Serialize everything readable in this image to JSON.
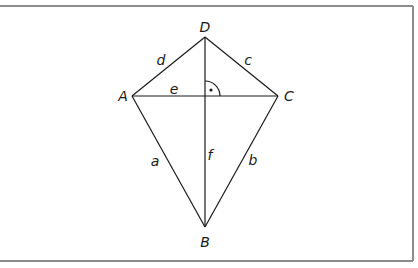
{
  "diagram": {
    "type": "geometry-figure",
    "colors": {
      "background": "#ffffff",
      "frame": "#8c8c8c",
      "lines": "#1a1a1a",
      "labels": "#1a1a1a"
    },
    "frame": {
      "top_y": 6,
      "right_x": 413,
      "bottom_y": 261,
      "sides": [
        "top",
        "right",
        "bottom"
      ]
    },
    "vertices": {
      "A": {
        "label": "A",
        "x": 132,
        "y": 96,
        "label_x": 123,
        "label_y": 101
      },
      "B": {
        "label": "B",
        "x": 205,
        "y": 227,
        "label_x": 205,
        "label_y": 247
      },
      "C": {
        "label": "C",
        "x": 278,
        "y": 96,
        "label_x": 288,
        "label_y": 101
      },
      "D": {
        "label": "D",
        "x": 205,
        "y": 37,
        "label_x": 205,
        "label_y": 31
      }
    },
    "sides": {
      "a": {
        "label": "a",
        "from": "A",
        "to": "B",
        "label_x": 155,
        "label_y": 166
      },
      "b": {
        "label": "b",
        "from": "B",
        "to": "C",
        "label_x": 253,
        "label_y": 165
      },
      "c": {
        "label": "c",
        "from": "C",
        "to": "D",
        "label_x": 248,
        "label_y": 65
      },
      "d": {
        "label": "d",
        "from": "D",
        "to": "A",
        "label_x": 161,
        "label_y": 65
      }
    },
    "diagonals": {
      "e": {
        "label": "e",
        "from": "A",
        "to": "C",
        "label_x": 174,
        "label_y": 94
      },
      "f": {
        "label": "f",
        "from": "D",
        "to": "B",
        "label_x": 210,
        "label_y": 160
      }
    },
    "right_angle": {
      "at_x": 205,
      "at_y": 96,
      "radius": 15,
      "dot_x": 211,
      "dot_y": 90
    }
  }
}
